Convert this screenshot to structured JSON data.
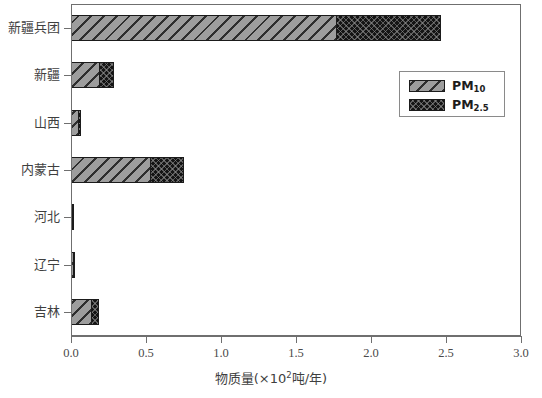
{
  "chart_data": {
    "type": "bar",
    "orientation": "horizontal",
    "stacked": true,
    "title": "",
    "xlabel_text": "物质量(×10",
    "xlabel_sup": "2",
    "xlabel_tail": "吨/年)",
    "ylabel": "",
    "xlim": [
      0.0,
      3.0
    ],
    "grid": false,
    "legend_position": "upper right",
    "categories": [
      "新疆兵团",
      "新疆",
      "山西",
      "内蒙古",
      "河北",
      "辽宁",
      "吉林"
    ],
    "xticks": [
      "0.0",
      "0.5",
      "1.0",
      "1.5",
      "2.0",
      "2.5",
      "3.0"
    ],
    "xtick_values": [
      0.0,
      0.5,
      1.0,
      1.5,
      2.0,
      2.5,
      3.0
    ],
    "series": [
      {
        "name": "PM10",
        "label_main": "PM",
        "label_sub": "10",
        "color": "#9d9d9d",
        "hatch": "diagonal",
        "values": [
          1.77,
          0.19,
          0.05,
          0.53,
          0.01,
          0.02,
          0.14
        ]
      },
      {
        "name": "PM2.5",
        "label_main": "PM",
        "label_sub": "2.5",
        "color": "#141414",
        "hatch": "cross-dot",
        "values": [
          0.7,
          0.1,
          0.02,
          0.23,
          0.01,
          0.01,
          0.05
        ]
      }
    ],
    "totals": [
      2.47,
      0.29,
      0.07,
      0.76,
      0.02,
      0.03,
      0.19
    ]
  },
  "axes": {
    "frame_color": "#6f6f6f",
    "tick_color": "#6f6f6f"
  }
}
